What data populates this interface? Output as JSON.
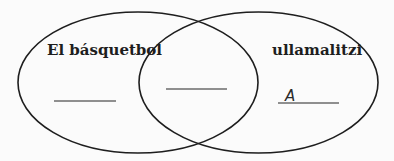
{
  "diagram": {
    "type": "venn",
    "sets": [
      {
        "id": "left",
        "label": "El básquetbol",
        "answer": ""
      },
      {
        "id": "right",
        "label": "ullamalitzi",
        "answer": "A"
      }
    ],
    "intersection": {
      "answer": ""
    },
    "colors": {
      "outline": "#1e1e1e",
      "answer_line": "#6b6b6b",
      "background": "#fbfbfb"
    }
  }
}
